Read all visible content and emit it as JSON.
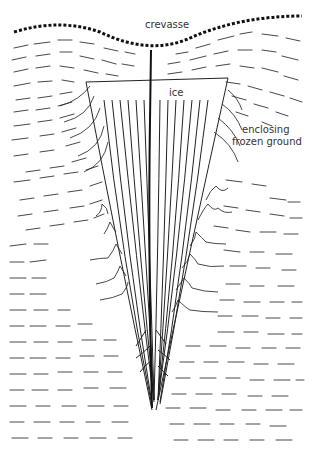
{
  "diagram": {
    "labels": {
      "crevasse": "crevasse",
      "ice": "ice",
      "enclosing_line1": "enclosing",
      "enclosing_line2": "frozen ground"
    },
    "colors": {
      "ink": "#1a1a1a",
      "background": "#ffffff"
    }
  }
}
